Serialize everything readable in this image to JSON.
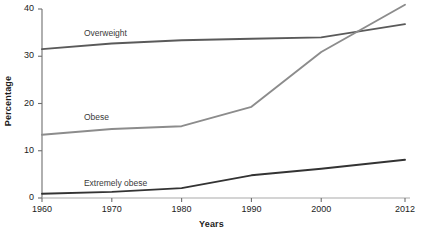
{
  "chart_data": {
    "type": "line",
    "title": "",
    "xlabel": "Years",
    "ylabel": "Percentage",
    "x": [
      1960,
      1970,
      1980,
      1990,
      2000,
      2012
    ],
    "xtick_labels": [
      "1960",
      "1970",
      "1980",
      "1990",
      "2000",
      "2012"
    ],
    "ytick_labels": [
      "0",
      "10",
      "20",
      "30",
      "40"
    ],
    "yticks": [
      0,
      10,
      20,
      30,
      40
    ],
    "xlim": [
      1960,
      2012
    ],
    "ylim": [
      0,
      40
    ],
    "grid": false,
    "legend_position": "inline-labels",
    "series": [
      {
        "name": "Overweight",
        "color": "#5a5a5a",
        "values": [
          31.5,
          32.7,
          33.4,
          33.7,
          34.0,
          36.8
        ]
      },
      {
        "name": "Obese",
        "color": "#8c8c8c",
        "values": [
          13.4,
          14.6,
          15.2,
          19.3,
          30.9,
          40.9
        ]
      },
      {
        "name": "Extremely obese",
        "color": "#333333",
        "values": [
          0.9,
          1.3,
          2.1,
          4.8,
          6.2,
          8.1
        ]
      }
    ],
    "annotations": [
      {
        "text": "Overweight",
        "x": 1966,
        "y": 34.8
      },
      {
        "text": "Obese",
        "x": 1966,
        "y": 17.0
      },
      {
        "text": "Extremely obese",
        "x": 1966,
        "y": 3.0
      }
    ]
  },
  "axes": {
    "y_title": "Percentage",
    "x_title": "Years",
    "y_ticks": [
      "40",
      "30",
      "20",
      "10",
      "0"
    ],
    "x_ticks": [
      "1960",
      "1970",
      "1980",
      "1990",
      "2000",
      "2012"
    ]
  },
  "labels": {
    "overweight": "Overweight",
    "obese": "Obese",
    "extremely_obese": "Extremely obese"
  },
  "colors": {
    "overweight": "#5a5a5a",
    "obese": "#8c8c8c",
    "extremely_obese": "#333333",
    "axis": "#6e6e6e",
    "background": "#ffffff"
  }
}
